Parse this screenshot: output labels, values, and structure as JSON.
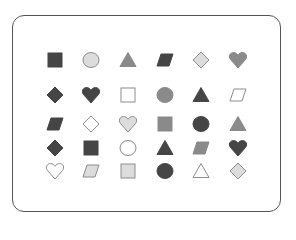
{
  "colors": {
    "dark": "#454545",
    "mid": "#8a8a8a",
    "light": "#dcdcdc",
    "outline": "#ffffff",
    "stroke": "#8c8c8c",
    "frame": "#555555"
  },
  "columns_x": [
    55,
    91,
    128,
    165,
    201,
    238
  ],
  "rows_y": [
    60,
    95,
    124,
    148,
    171
  ],
  "grid": [
    [
      {
        "shape": "square",
        "fill": "dark"
      },
      {
        "shape": "circle",
        "fill": "light"
      },
      {
        "shape": "triangle",
        "fill": "mid"
      },
      {
        "shape": "parallelogram",
        "fill": "dark"
      },
      {
        "shape": "diamond",
        "fill": "light"
      },
      {
        "shape": "heart",
        "fill": "mid"
      }
    ],
    [
      {
        "shape": "diamond",
        "fill": "dark"
      },
      {
        "shape": "heart",
        "fill": "dark"
      },
      {
        "shape": "square",
        "fill": "outline"
      },
      {
        "shape": "circle",
        "fill": "mid"
      },
      {
        "shape": "triangle",
        "fill": "dark"
      },
      {
        "shape": "parallelogram",
        "fill": "outline"
      }
    ],
    [
      {
        "shape": "parallelogram",
        "fill": "dark"
      },
      {
        "shape": "diamond",
        "fill": "outline"
      },
      {
        "shape": "heart",
        "fill": "light"
      },
      {
        "shape": "square",
        "fill": "mid"
      },
      {
        "shape": "circle",
        "fill": "dark"
      },
      {
        "shape": "triangle",
        "fill": "mid"
      }
    ],
    [
      {
        "shape": "diamond",
        "fill": "dark"
      },
      {
        "shape": "square",
        "fill": "dark"
      },
      {
        "shape": "circle",
        "fill": "outline"
      },
      {
        "shape": "triangle",
        "fill": "dark"
      },
      {
        "shape": "parallelogram",
        "fill": "mid"
      },
      {
        "shape": "heart",
        "fill": "dark"
      }
    ],
    [
      {
        "shape": "heart",
        "fill": "outline"
      },
      {
        "shape": "parallelogram",
        "fill": "light"
      },
      {
        "shape": "square",
        "fill": "light"
      },
      {
        "shape": "circle",
        "fill": "dark"
      },
      {
        "shape": "triangle",
        "fill": "outline"
      },
      {
        "shape": "diamond",
        "fill": "light"
      }
    ]
  ]
}
